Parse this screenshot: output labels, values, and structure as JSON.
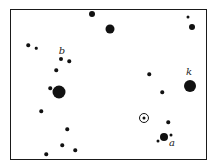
{
  "diagram": {
    "type": "star-field",
    "frame": {
      "left": 10,
      "top": 9,
      "right": 206,
      "bottom": 159
    },
    "colors": {
      "ink": "#111111",
      "background": "#ffffff"
    },
    "labels": [
      {
        "id": "b",
        "text": "b",
        "x": 62,
        "y": 51
      },
      {
        "id": "k",
        "text": "k",
        "x": 189,
        "y": 72
      },
      {
        "id": "a",
        "text": "a",
        "x": 172,
        "y": 143
      }
    ],
    "sun": {
      "symbol": "sun-icon",
      "x": 144,
      "y": 118
    },
    "stars": [
      {
        "x": 92,
        "y": 14,
        "d": 6
      },
      {
        "x": 110,
        "y": 29,
        "d": 9
      },
      {
        "x": 188,
        "y": 17,
        "d": 3
      },
      {
        "x": 192,
        "y": 27,
        "d": 6
      },
      {
        "x": 28,
        "y": 45,
        "d": 3.5
      },
      {
        "x": 36,
        "y": 48,
        "d": 2.5
      },
      {
        "x": 61,
        "y": 59,
        "d": 4
      },
      {
        "x": 69,
        "y": 61,
        "d": 3.5
      },
      {
        "x": 56,
        "y": 70,
        "d": 3.5
      },
      {
        "x": 149,
        "y": 74,
        "d": 3.5
      },
      {
        "x": 190,
        "y": 86,
        "d": 12
      },
      {
        "x": 50,
        "y": 88,
        "d": 3.5
      },
      {
        "x": 59,
        "y": 92,
        "d": 13
      },
      {
        "x": 162,
        "y": 92,
        "d": 3.5
      },
      {
        "x": 41,
        "y": 111,
        "d": 3.5
      },
      {
        "x": 168,
        "y": 122,
        "d": 3.5
      },
      {
        "x": 67,
        "y": 129,
        "d": 3.5
      },
      {
        "x": 164,
        "y": 137,
        "d": 8
      },
      {
        "x": 171,
        "y": 135,
        "d": 3
      },
      {
        "x": 158,
        "y": 141,
        "d": 3
      },
      {
        "x": 62,
        "y": 145,
        "d": 3.5
      },
      {
        "x": 75,
        "y": 150,
        "d": 3.5
      },
      {
        "x": 46,
        "y": 154,
        "d": 3.5
      }
    ]
  }
}
